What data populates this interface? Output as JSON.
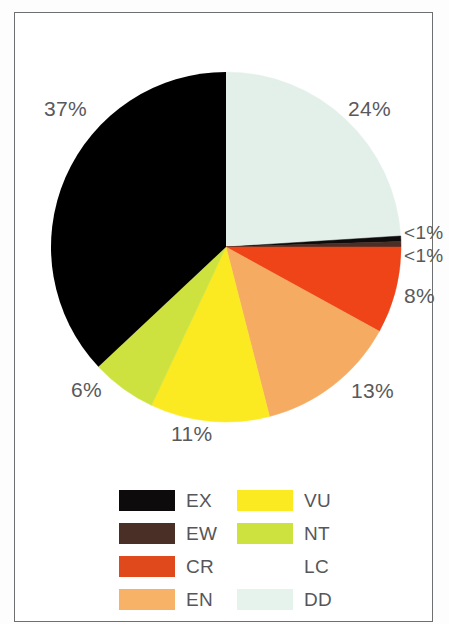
{
  "figure": {
    "frame": {
      "border_color": "#6d6f70"
    },
    "background": "#ffffff"
  },
  "chart_data": {
    "type": "pie",
    "title": "",
    "subtitle": "",
    "xlabel": "",
    "ylabel": "",
    "legend_position": "bottom",
    "grid": false,
    "start_angle_deg": 0,
    "direction": "clockwise",
    "categories": [
      "EX",
      "EW",
      "CR",
      "EN",
      "VU",
      "NT",
      "LC",
      "DD"
    ],
    "labels": [
      "<1%",
      "<1%",
      "8%",
      "13%",
      "11%",
      "6%",
      "37%",
      "24%"
    ],
    "values": [
      0.5,
      0.5,
      8,
      13,
      11,
      6,
      37,
      24
    ],
    "colors": [
      "#0d0b0c",
      "#4a3027",
      "#e8431a",
      "#f7ad62",
      "#f9ea22",
      "#cbe03f",
      "#65b martin",
      "#e2f0ea"
    ],
    "slices": [
      {
        "key": "DD",
        "label": "DD",
        "percent_label": "24%",
        "value": 24,
        "color": "#e3f0ea"
      },
      {
        "key": "EX",
        "label": "EX",
        "percent_label": "<1%",
        "value": 0.5,
        "color": "#0d0b0c"
      },
      {
        "key": "EW",
        "label": "EW",
        "percent_label": "<1%",
        "value": 0.5,
        "color": "#4a2f26"
      },
      {
        "key": "CR",
        "label": "CR",
        "percent_label": "8%",
        "value": 8,
        "color": "#ef4318"
      },
      {
        "key": "EN",
        "label": "EN",
        "percent_label": "13%",
        "value": 13,
        "color": "#f6ab63"
      },
      {
        "key": "VU",
        "label": "VU",
        "percent_label": "11%",
        "value": 11,
        "color": "#fbea21"
      },
      {
        "key": "NT",
        "label": "NT",
        "percent_label": "6%",
        "value": 6,
        "color": "#cde23f"
      },
      {
        "key": "LC",
        "label": "LC",
        "percent_label": "37%",
        "value": 37,
        "color": "#67b košík"
      }
    ]
  },
  "pie": {
    "center_x": 211,
    "center_y": 234,
    "radius": 175,
    "percent_labels": {
      "lc": "37%",
      "dd": "24%",
      "ex": "<1%",
      "ew": "<1%",
      "cr": "8%",
      "en": "13%",
      "vu": "11%",
      "nt": "6%"
    }
  },
  "legend": {
    "columns": 2,
    "rows": 4,
    "items": [
      {
        "label": "EX",
        "color": "#0d0b0c",
        "column": 1,
        "row": 1
      },
      {
        "label": "VU",
        "color": "#fbea21",
        "column": 2,
        "row": 1
      },
      {
        "label": "EW",
        "color": "#4a2f26",
        "column": 1,
        "row": 2
      },
      {
        "label": "NT",
        "color": "#cde23f",
        "column": 2,
        "row": 2
      },
      {
        "label": "CR",
        "color": "#e0491c",
        "column": 1,
        "row": 3
      },
      {
        "label": "LC",
        "color": "#6cb köz",
        "column": 2,
        "row": 3
      },
      {
        "label": "EN",
        "color": "#f8b268",
        "column": 1,
        "row": 4
      },
      {
        "label": "DD",
        "color": "#e6f2ec",
        "column": 2,
        "row": 4
      }
    ]
  }
}
